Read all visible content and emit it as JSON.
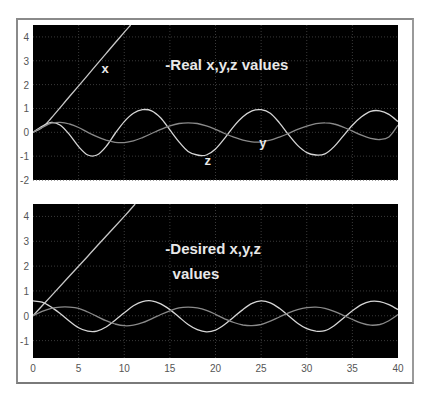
{
  "chart_data": [
    {
      "type": "line",
      "title": "-Real x,y,z values",
      "xlabel": "",
      "ylabel": "",
      "xlim": [
        0,
        40
      ],
      "ylim": [
        -2,
        4.5
      ],
      "xticks": [],
      "yticks": [
        "-2",
        "-1",
        "0",
        "1",
        "2",
        "3",
        "4"
      ],
      "grid": true,
      "background": "#000000",
      "annotations": [
        {
          "text": "-Real x,y,z values",
          "x": 14.5,
          "y": 2.6
        },
        {
          "text": "x",
          "x": 7.5,
          "y": 2.5
        },
        {
          "text": "y",
          "x": 24.8,
          "y": -0.6
        },
        {
          "text": "z",
          "x": 18.8,
          "y": -1.35
        }
      ],
      "series": [
        {
          "name": "x",
          "color": "#c8c8c8",
          "points": [
            [
              0,
              0
            ],
            [
              1,
              0.2
            ],
            [
              2,
              0.6
            ],
            [
              4,
              1.5
            ],
            [
              6,
              2.4
            ],
            [
              8,
              3.3
            ],
            [
              10,
              4.2
            ],
            [
              10.7,
              4.5
            ]
          ]
        },
        {
          "name": "z",
          "color": "#d6d6d6",
          "points": [
            [
              0,
              0
            ],
            [
              1,
              0.25
            ],
            [
              2,
              0.42
            ],
            [
              3,
              0.3
            ],
            [
              4,
              -0.1
            ],
            [
              5,
              -0.6
            ],
            [
              6,
              -0.95
            ],
            [
              7,
              -0.95
            ],
            [
              8,
              -0.6
            ],
            [
              9,
              -0.05
            ],
            [
              10,
              0.45
            ],
            [
              11,
              0.8
            ],
            [
              12,
              0.95
            ],
            [
              13,
              0.9
            ],
            [
              14,
              0.6
            ],
            [
              15,
              0.1
            ],
            [
              16,
              -0.4
            ],
            [
              17,
              -0.8
            ],
            [
              18,
              -0.95
            ],
            [
              19,
              -0.95
            ],
            [
              20,
              -0.7
            ],
            [
              21,
              -0.25
            ],
            [
              22,
              0.25
            ],
            [
              23,
              0.65
            ],
            [
              24,
              0.9
            ],
            [
              25,
              0.95
            ],
            [
              26,
              0.8
            ],
            [
              27,
              0.4
            ],
            [
              28,
              -0.1
            ],
            [
              29,
              -0.55
            ],
            [
              30,
              -0.85
            ],
            [
              31,
              -0.95
            ],
            [
              32,
              -0.9
            ],
            [
              33,
              -0.6
            ],
            [
              34,
              -0.15
            ],
            [
              35,
              0.3
            ],
            [
              36,
              0.65
            ],
            [
              37,
              0.88
            ],
            [
              38,
              0.9
            ],
            [
              39,
              0.75
            ],
            [
              40,
              0.45
            ]
          ]
        },
        {
          "name": "y",
          "color": "#8a8a8a",
          "points": [
            [
              0,
              0
            ],
            [
              1,
              0.2
            ],
            [
              2,
              0.38
            ],
            [
              3,
              0.42
            ],
            [
              4,
              0.35
            ],
            [
              5,
              0.2
            ],
            [
              6,
              0.0
            ],
            [
              7,
              -0.18
            ],
            [
              8,
              -0.33
            ],
            [
              9,
              -0.42
            ],
            [
              10,
              -0.43
            ],
            [
              11,
              -0.36
            ],
            [
              12,
              -0.22
            ],
            [
              13,
              -0.05
            ],
            [
              14,
              0.12
            ],
            [
              15,
              0.27
            ],
            [
              16,
              0.37
            ],
            [
              17,
              0.4
            ],
            [
              18,
              0.37
            ],
            [
              19,
              0.27
            ],
            [
              20,
              0.12
            ],
            [
              21,
              -0.05
            ],
            [
              22,
              -0.2
            ],
            [
              23,
              -0.33
            ],
            [
              24,
              -0.4
            ],
            [
              25,
              -0.4
            ],
            [
              26,
              -0.33
            ],
            [
              27,
              -0.2
            ],
            [
              28,
              -0.05
            ],
            [
              29,
              0.12
            ],
            [
              30,
              0.26
            ],
            [
              31,
              0.36
            ],
            [
              32,
              0.4
            ],
            [
              33,
              0.35
            ],
            [
              34,
              0.22
            ],
            [
              35,
              0.05
            ],
            [
              36,
              -0.12
            ],
            [
              37,
              -0.25
            ],
            [
              38,
              -0.3
            ],
            [
              39,
              -0.2
            ],
            [
              40,
              0.3
            ]
          ]
        }
      ]
    },
    {
      "type": "line",
      "title": "-Desired x,y,z values",
      "xlabel": "",
      "ylabel": "",
      "xlim": [
        0,
        40
      ],
      "ylim": [
        -1.7,
        4.5
      ],
      "xticks": [
        "0",
        "5",
        "10",
        "15",
        "20",
        "25",
        "30",
        "35",
        "40"
      ],
      "yticks": [
        "-1",
        "0",
        "1",
        "2",
        "3",
        "4"
      ],
      "grid": true,
      "background": "#000000",
      "annotations": [
        {
          "text": "-Desired x,y,z",
          "x": 14.5,
          "y": 2.5
        },
        {
          "text": "values",
          "x": 15.3,
          "y": 1.5
        }
      ],
      "series": [
        {
          "name": "x",
          "color": "#c8c8c8",
          "points": [
            [
              0,
              0
            ],
            [
              2,
              0.8
            ],
            [
              4,
              1.6
            ],
            [
              6,
              2.4
            ],
            [
              8,
              3.2
            ],
            [
              10,
              4.0
            ],
            [
              11.2,
              4.5
            ]
          ]
        },
        {
          "name": "z",
          "color": "#d6d6d6",
          "points": [
            [
              0,
              0.6
            ],
            [
              1,
              0.55
            ],
            [
              2,
              0.35
            ],
            [
              3,
              0.08
            ],
            [
              4,
              -0.22
            ],
            [
              5,
              -0.48
            ],
            [
              6,
              -0.62
            ],
            [
              7,
              -0.62
            ],
            [
              8,
              -0.45
            ],
            [
              9,
              -0.18
            ],
            [
              10,
              0.12
            ],
            [
              11,
              0.4
            ],
            [
              12,
              0.57
            ],
            [
              13,
              0.6
            ],
            [
              14,
              0.48
            ],
            [
              15,
              0.25
            ],
            [
              16,
              -0.05
            ],
            [
              17,
              -0.35
            ],
            [
              18,
              -0.56
            ],
            [
              19,
              -0.65
            ],
            [
              20,
              -0.58
            ],
            [
              21,
              -0.35
            ],
            [
              22,
              -0.05
            ],
            [
              23,
              0.25
            ],
            [
              24,
              0.5
            ],
            [
              25,
              0.6
            ],
            [
              26,
              0.52
            ],
            [
              27,
              0.3
            ],
            [
              28,
              0.0
            ],
            [
              29,
              -0.3
            ],
            [
              30,
              -0.52
            ],
            [
              31,
              -0.62
            ],
            [
              32,
              -0.6
            ],
            [
              33,
              -0.4
            ],
            [
              34,
              -0.1
            ],
            [
              35,
              0.2
            ],
            [
              36,
              0.45
            ],
            [
              37,
              0.58
            ],
            [
              38,
              0.57
            ],
            [
              39,
              0.45
            ],
            [
              40,
              0.25
            ]
          ]
        },
        {
          "name": "y",
          "color": "#8a8a8a",
          "points": [
            [
              0,
              0
            ],
            [
              1,
              0.18
            ],
            [
              2,
              0.3
            ],
            [
              3,
              0.35
            ],
            [
              4,
              0.35
            ],
            [
              5,
              0.3
            ],
            [
              6,
              0.15
            ],
            [
              7,
              -0.02
            ],
            [
              8,
              -0.2
            ],
            [
              9,
              -0.33
            ],
            [
              10,
              -0.4
            ],
            [
              11,
              -0.38
            ],
            [
              12,
              -0.28
            ],
            [
              13,
              -0.12
            ],
            [
              14,
              0.05
            ],
            [
              15,
              0.2
            ],
            [
              16,
              0.32
            ],
            [
              17,
              0.35
            ],
            [
              18,
              0.32
            ],
            [
              19,
              0.22
            ],
            [
              20,
              0.06
            ],
            [
              21,
              -0.12
            ],
            [
              22,
              -0.27
            ],
            [
              23,
              -0.37
            ],
            [
              24,
              -0.4
            ],
            [
              25,
              -0.35
            ],
            [
              26,
              -0.22
            ],
            [
              27,
              -0.05
            ],
            [
              28,
              0.12
            ],
            [
              29,
              0.25
            ],
            [
              30,
              0.33
            ],
            [
              31,
              0.35
            ],
            [
              32,
              0.3
            ],
            [
              33,
              0.18
            ],
            [
              34,
              0.02
            ],
            [
              35,
              -0.15
            ],
            [
              36,
              -0.3
            ],
            [
              37,
              -0.38
            ],
            [
              38,
              -0.35
            ],
            [
              39,
              -0.2
            ],
            [
              40,
              0.05
            ]
          ]
        }
      ]
    }
  ]
}
